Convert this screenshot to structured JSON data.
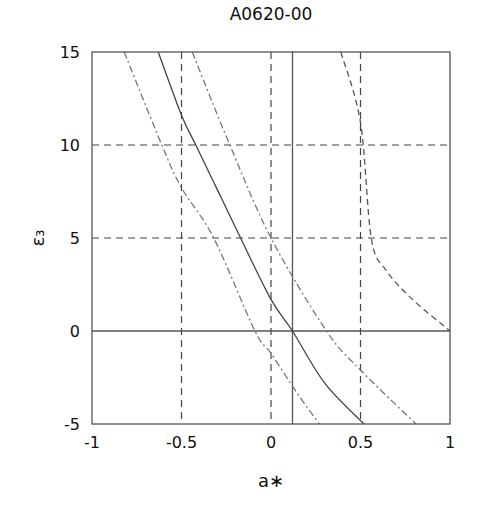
{
  "chart_data": {
    "type": "line",
    "title": "A0620-00",
    "xlabel": "a∗",
    "ylabel": "ε₃",
    "xlim": [
      -1,
      1
    ],
    "ylim": [
      -5,
      15
    ],
    "xticks": [
      -1,
      -0.5,
      0,
      0.5,
      1
    ],
    "xtick_labels": [
      "-1",
      "-0.5",
      "0",
      "0.5",
      "1"
    ],
    "yticks": [
      -5,
      0,
      5,
      10,
      15
    ],
    "ytick_labels": [
      "-5",
      "0",
      "5",
      "10",
      "15"
    ],
    "grid": {
      "vertical_dashed": [
        -0.5,
        0,
        0.5
      ],
      "horizontal_dashed": [
        5,
        10
      ],
      "horizontal_solid": [
        0
      ],
      "vertical_solid": [
        0.12
      ]
    },
    "legend": null,
    "series": [
      {
        "name": "solid",
        "style": "solid",
        "color": "#444444",
        "x": [
          -0.63,
          -0.5,
          -0.42,
          -0.3,
          -0.17,
          0.0,
          0.12,
          0.3,
          0.52
        ],
        "y": [
          15,
          11.6,
          10,
          7.6,
          5,
          1.7,
          0,
          -2.8,
          -5
        ]
      },
      {
        "name": "dash-dot left",
        "style": "dashdot",
        "color": "#777777",
        "x": [
          -0.82,
          -0.61,
          -0.5,
          -0.32,
          -0.09,
          0.0,
          0.15,
          0.27
        ],
        "y": [
          15,
          10,
          7.7,
          5,
          0,
          -1.2,
          -3.4,
          -5
        ]
      },
      {
        "name": "dash-dot right",
        "style": "dashdot",
        "color": "#777777",
        "x": [
          -0.44,
          -0.23,
          0.0,
          0.31,
          0.5,
          0.81
        ],
        "y": [
          15,
          10,
          5,
          0,
          -2.1,
          -5
        ]
      },
      {
        "name": "dashed",
        "style": "dashed",
        "color": "#555555",
        "x": [
          0.39,
          0.5,
          0.56,
          0.64,
          0.79,
          1.0
        ],
        "y": [
          15,
          11.2,
          5,
          3.3,
          1.7,
          0
        ]
      }
    ]
  }
}
